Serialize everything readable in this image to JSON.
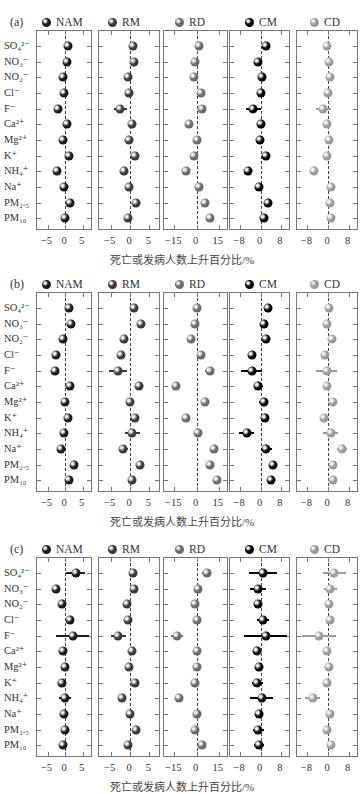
{
  "chart_data": [
    {
      "type": "scatter",
      "panel": "(a)",
      "title": "",
      "xlabel": "死亡或发病人数上升百分比/%",
      "rows": [
        "SO₄²⁻",
        "NO₃⁻",
        "NO₂⁻",
        "Cl⁻",
        "F⁻",
        "Ca²⁺",
        "Mg²⁺",
        "K⁺",
        "NH₄⁺",
        "Na⁺",
        "PM₂.₅",
        "PM₁₀"
      ],
      "series": [
        {
          "name": "NAM",
          "color": "#1a1a1a",
          "xlim": [
            -8,
            8
          ],
          "ticks": [
            -5,
            0,
            5
          ],
          "values": [
            0.8,
            0.5,
            -0.7,
            -0.2,
            -2.1,
            0.5,
            -0.5,
            1.0,
            -2.2,
            -0.3,
            1.3,
            0.1
          ],
          "err": [
            0.4,
            0.4,
            0.4,
            0.4,
            0.9,
            0.4,
            0.4,
            0.4,
            0.5,
            0.4,
            0.4,
            0.4
          ]
        },
        {
          "name": "RM",
          "color": "#3a3a3a",
          "xlim": [
            -8,
            8
          ],
          "ticks": [
            -5,
            0,
            5
          ],
          "values": [
            0.7,
            1.0,
            -0.6,
            -0.3,
            -2.5,
            0.6,
            -0.3,
            1.2,
            -1.5,
            -0.2,
            1.6,
            -0.4
          ],
          "err": [
            0.4,
            0.4,
            0.4,
            0.4,
            1.7,
            0.4,
            0.4,
            0.4,
            0.6,
            0.4,
            0.4,
            0.4
          ]
        },
        {
          "name": "RD",
          "color": "#6a6a6a",
          "xlim": [
            -22,
            22
          ],
          "ticks": [
            -15,
            0,
            15
          ],
          "values": [
            2,
            -1,
            -2,
            3,
            4,
            -5,
            0,
            -2,
            -7,
            2,
            6,
            9
          ],
          "err": [
            1,
            1,
            1,
            1.5,
            2,
            1,
            1,
            1,
            1.5,
            1,
            1,
            1
          ]
        },
        {
          "name": "CM",
          "color": "#000000",
          "xlim": [
            -12,
            12
          ],
          "ticks": [
            -8,
            0,
            8
          ],
          "values": [
            2.3,
            -1.0,
            0.5,
            0.3,
            -2.8,
            0.0,
            -0.3,
            2.1,
            -4.9,
            -0.4,
            3.0,
            1.4
          ],
          "err": [
            0.5,
            0.5,
            0.5,
            0.5,
            3.0,
            0.5,
            0.5,
            0.5,
            1.2,
            0.5,
            0.5,
            0.5
          ]
        },
        {
          "name": "CD",
          "color": "#9a9a9a",
          "xlim": [
            -12,
            12
          ],
          "ticks": [
            -8,
            0,
            8
          ],
          "values": [
            -0.3,
            0.2,
            0.6,
            0.1,
            -1.8,
            -0.5,
            0.2,
            -0.3,
            -5.5,
            1.3,
            0.8,
            1.0
          ],
          "err": [
            0.5,
            0.5,
            0.5,
            0.5,
            3.0,
            0.5,
            0.5,
            0.5,
            1.2,
            0.5,
            0.5,
            0.5
          ]
        }
      ]
    },
    {
      "type": "scatter",
      "panel": "(b)",
      "title": "",
      "xlabel": "死亡或发病人数上升百分比/%",
      "rows": [
        "SO₄²⁻",
        "NO₃⁻",
        "NO₂⁻",
        "Cl⁻",
        "F⁻",
        "Ca²⁺",
        "Mg²⁺",
        "K⁺",
        "NH₄⁺",
        "Na⁺",
        "PM₂.₅",
        "PM₁₀"
      ],
      "series": [
        {
          "name": "NAM",
          "color": "#1a1a1a",
          "xlim": [
            -8,
            8
          ],
          "ticks": [
            -5,
            0,
            5
          ],
          "values": [
            1.2,
            1.7,
            -0.5,
            -2.5,
            -2.8,
            1.4,
            0.1,
            0.9,
            -0.4,
            -1.2,
            2.5,
            1.1
          ],
          "err": [
            0.4,
            0.4,
            0.4,
            0.5,
            1.2,
            0.4,
            0.4,
            0.4,
            1.1,
            0.4,
            0.4,
            0.4
          ]
        },
        {
          "name": "RM",
          "color": "#3a3a3a",
          "xlim": [
            -8,
            8
          ],
          "ticks": [
            -5,
            0,
            5
          ],
          "values": [
            1.0,
            2.8,
            -1.5,
            -2.2,
            -3.0,
            2.3,
            0.1,
            1.3,
            0.6,
            -1.7,
            2.5,
            0.5
          ],
          "err": [
            0.4,
            0.6,
            1.0,
            0.4,
            2.3,
            1.0,
            1.0,
            0.5,
            1.9,
            1.1,
            0.5,
            0.7
          ]
        },
        {
          "name": "RD",
          "color": "#6a6a6a",
          "xlim": [
            -22,
            22
          ],
          "ticks": [
            -15,
            0,
            15
          ],
          "values": [
            0,
            -1,
            -4,
            3,
            9,
            -14,
            6,
            -7,
            1,
            12,
            9,
            14
          ],
          "err": [
            1,
            1,
            1,
            1,
            3,
            1,
            1,
            1,
            3,
            1.5,
            1,
            1
          ]
        },
        {
          "name": "CM",
          "color": "#000000",
          "xlim": [
            -12,
            12
          ],
          "ticks": [
            -8,
            0,
            8
          ],
          "values": [
            3.0,
            1.4,
            2.0,
            -3.5,
            -3.5,
            -0.8,
            1.2,
            1.7,
            -5.5,
            2.3,
            5.0,
            4.2
          ],
          "err": [
            0.5,
            0.5,
            1.6,
            0.8,
            4.0,
            1.8,
            1.8,
            0.5,
            3.0,
            2.2,
            0.8,
            1.5
          ]
        },
        {
          "name": "CD",
          "color": "#9a9a9a",
          "xlim": [
            -12,
            12
          ],
          "ticks": [
            -8,
            0,
            8
          ],
          "values": [
            0.5,
            -0.5,
            1.5,
            -1.0,
            -0.5,
            -0.5,
            2.0,
            -1.5,
            1.0,
            5.5,
            1.8,
            2.0
          ],
          "err": [
            0.5,
            0.5,
            1.2,
            0.5,
            4.0,
            1.6,
            1.6,
            0.5,
            3.0,
            2.0,
            0.8,
            1.3
          ]
        }
      ]
    },
    {
      "type": "scatter",
      "panel": "(c)",
      "title": "",
      "xlabel": "死亡或发病人数上升百分比/%",
      "rows": [
        "SO₄²⁻",
        "NO₃⁻",
        "NO₂⁻",
        "Cl⁻",
        "F⁻",
        "Ca²⁺",
        "Mg²⁺",
        "K⁺",
        "NH₄⁺",
        "Na⁺",
        "PM₂.₅",
        "PM₁₀"
      ],
      "series": [
        {
          "name": "NAM",
          "color": "#1a1a1a",
          "xlim": [
            -8,
            8
          ],
          "ticks": [
            -5,
            0,
            5
          ],
          "values": [
            3.0,
            -2.5,
            -0.8,
            1.5,
            2.2,
            -0.5,
            0.1,
            -1.0,
            0.0,
            -0.2,
            0.0,
            -0.7
          ],
          "err": [
            2.8,
            1.2,
            0.4,
            0.8,
            4.8,
            0.4,
            0.4,
            0.4,
            1.6,
            0.4,
            0.4,
            0.4
          ]
        },
        {
          "name": "RM",
          "color": "#3a3a3a",
          "xlim": [
            -8,
            8
          ],
          "ticks": [
            -5,
            0,
            5
          ],
          "values": [
            0.7,
            1.0,
            -0.8,
            -0.6,
            -3.0,
            0.5,
            -0.2,
            1.3,
            -2.0,
            -0.1,
            1.6,
            -0.6
          ],
          "err": [
            0.4,
            0.4,
            0.4,
            0.4,
            1.9,
            0.4,
            0.4,
            0.4,
            0.8,
            0.4,
            0.4,
            0.4
          ]
        },
        {
          "name": "RD",
          "color": "#6a6a6a",
          "xlim": [
            -22,
            22
          ],
          "ticks": [
            -15,
            0,
            15
          ],
          "values": [
            7,
            1,
            -1,
            0,
            -13,
            0,
            0,
            -1,
            -12,
            0,
            -1,
            4
          ],
          "err": [
            3,
            2,
            1,
            1,
            4,
            1,
            1,
            1,
            2,
            1,
            1,
            1.5
          ]
        },
        {
          "name": "CM",
          "color": "#000000",
          "xlim": [
            -12,
            12
          ],
          "ticks": [
            -8,
            0,
            8
          ],
          "values": [
            0.8,
            -1.0,
            -0.8,
            1.0,
            2.0,
            -1.5,
            -0.5,
            -1.2,
            0.5,
            -0.5,
            -0.8,
            -0.6
          ],
          "err": [
            5.5,
            3.3,
            1.2,
            2.5,
            8.5,
            1.0,
            1.0,
            2.0,
            4.5,
            1.2,
            2.0,
            2.0
          ]
        },
        {
          "name": "CD",
          "color": "#9a9a9a",
          "xlim": [
            -12,
            12
          ],
          "ticks": [
            -8,
            0,
            8
          ],
          "values": [
            2.5,
            0.8,
            0.5,
            0.7,
            -3.5,
            -0.5,
            0.3,
            -0.5,
            -6.0,
            0.8,
            -0.5,
            1.0
          ],
          "err": [
            4.6,
            2.5,
            0.6,
            1.5,
            6.5,
            0.6,
            0.6,
            0.8,
            3.0,
            0.6,
            1.2,
            1.2
          ]
        }
      ]
    }
  ],
  "panels": [
    {
      "label": "(a)"
    },
    {
      "label": "(b)"
    },
    {
      "label": "(c)"
    }
  ],
  "legend": [
    "NAM",
    "RM",
    "RD",
    "CM",
    "CD"
  ],
  "row_labels": [
    "SO₄²⁻",
    "NO₃⁻",
    "NO₂⁻",
    "Cl⁻",
    "F⁻",
    "Ca²⁺",
    "Mg²⁺",
    "K⁺",
    "NH₄⁺",
    "Na⁺",
    "PM₂.₅",
    "PM₁₀"
  ],
  "xlabel": "死亡或发病人数上升百分比/%"
}
